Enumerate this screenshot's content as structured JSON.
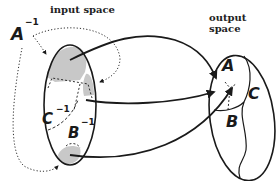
{
  "titles": {
    "input": "input space",
    "output": "output space"
  },
  "input_labels": {
    "a": "A",
    "b": "B",
    "c": "C",
    "inv": "−1"
  },
  "output_labels": {
    "a": "A",
    "b": "B",
    "c": "C"
  },
  "colors": {
    "stroke": "#1a1a1a",
    "shade": "#c8c8c8",
    "background": "#ffffff"
  }
}
